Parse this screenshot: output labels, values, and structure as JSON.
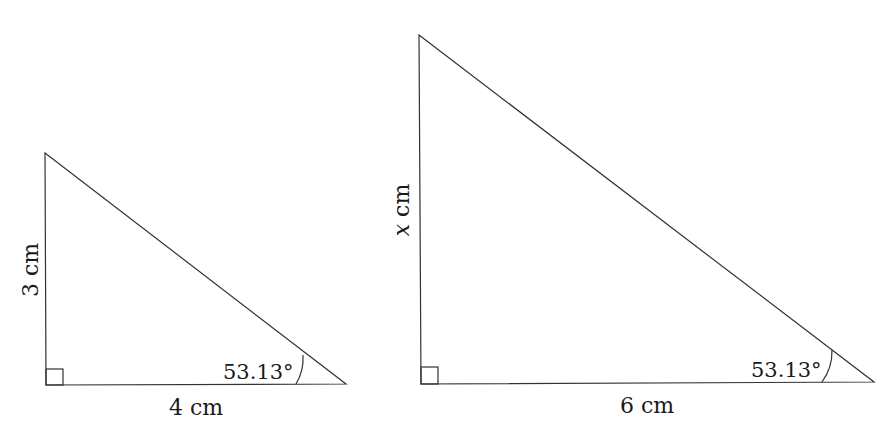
{
  "diagram": {
    "triangles": [
      {
        "name": "small-triangle",
        "vertical_label": "3 cm",
        "base_label": "4 cm",
        "angle_label": "53.13°",
        "right_angle": true
      },
      {
        "name": "large-triangle",
        "vertical_label_var": "x",
        "vertical_label_unit": " cm",
        "base_label": "6 cm",
        "angle_label": "53.13°",
        "right_angle": true
      }
    ],
    "colors": {
      "stroke": "#333333",
      "text": "#1a1a1a",
      "background": "#ffffff"
    }
  }
}
